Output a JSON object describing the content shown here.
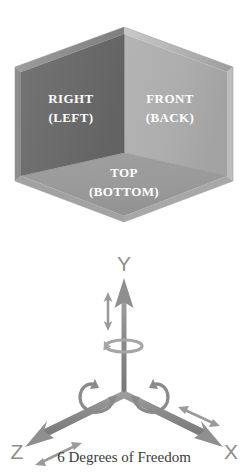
{
  "figure": {
    "caption": "6 Degrees of Freedom"
  },
  "cube": {
    "faces": [
      {
        "id": "left",
        "primary": "RIGHT",
        "secondary": "(LEFT)",
        "color": "#6b6b6b",
        "edge_color": "#8a8a8a"
      },
      {
        "id": "right",
        "primary": "FRONT",
        "secondary": "(BACK)",
        "color": "#adadad",
        "edge_color": "#c3c3c3"
      },
      {
        "id": "bottom",
        "primary": "TOP",
        "secondary": "(BOTTOM)",
        "color": "#9a9a9a",
        "edge_color": "#b4b4b4"
      }
    ],
    "label_color": "#ffffff"
  },
  "axes": {
    "color": "#8e8e8e",
    "items": [
      {
        "id": "y",
        "label": "Y",
        "direction": "up",
        "translation": "double-arrow",
        "rotation": "curl"
      },
      {
        "id": "z",
        "label": "Z",
        "direction": "lower-left",
        "translation": "double-arrow",
        "rotation": "curl"
      },
      {
        "id": "x",
        "label": "X",
        "direction": "lower-right",
        "translation": "double-arrow",
        "rotation": "curl"
      }
    ]
  }
}
